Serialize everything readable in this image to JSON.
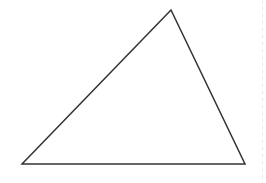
{
  "figure": {
    "shape": "triangle",
    "stroke_color": "#333333",
    "fill_color": "#ffffff",
    "stroke_width": 1.5,
    "vertices": {
      "top": [
        171,
        10
      ],
      "bottom_left": [
        22,
        164
      ],
      "bottom_right": [
        245,
        164
      ]
    },
    "points": "171,10 22,164 245,164"
  }
}
